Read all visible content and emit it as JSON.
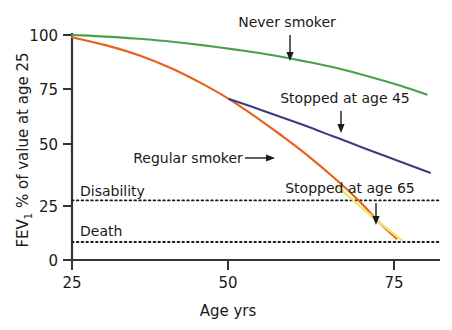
{
  "chart_data": {
    "type": "line",
    "title": "",
    "xlabel": "Age yrs",
    "ylabel": "FEV1 % of value at age 25",
    "ylabel_main": "FEV",
    "ylabel_sub": "1",
    "ylabel_rest": " % of value at age 25",
    "xlim": [
      25,
      80
    ],
    "ylim": [
      0,
      105
    ],
    "xticks": [
      25,
      50,
      75
    ],
    "xticklabels": [
      "25",
      "50",
      "75"
    ],
    "yticks": [
      0,
      25,
      50,
      75,
      100
    ],
    "yticklabels": [
      "0",
      "25",
      "50",
      "75",
      "100"
    ],
    "grid": false,
    "legend": "annotations-with-arrows",
    "series": [
      {
        "name": "Never smoker",
        "color": "#4aa04a",
        "label": "Never smoker",
        "points": [
          {
            "x": 25,
            "y": 100
          },
          {
            "x": 30,
            "y": 99.3
          },
          {
            "x": 35,
            "y": 98.3
          },
          {
            "x": 40,
            "y": 97.0
          },
          {
            "x": 45,
            "y": 95.3
          },
          {
            "x": 50,
            "y": 93.3
          },
          {
            "x": 55,
            "y": 91.0
          },
          {
            "x": 60,
            "y": 88.2
          },
          {
            "x": 65,
            "y": 85.0
          },
          {
            "x": 70,
            "y": 81.0
          },
          {
            "x": 75,
            "y": 76.6
          },
          {
            "x": 78,
            "y": 73.5
          }
        ]
      },
      {
        "name": "Regular smoker",
        "color": "#e8601c",
        "label": "Regular smoker",
        "points": [
          {
            "x": 25,
            "y": 99
          },
          {
            "x": 30,
            "y": 95.5
          },
          {
            "x": 35,
            "y": 91.0
          },
          {
            "x": 40,
            "y": 85.0
          },
          {
            "x": 45,
            "y": 77.5
          },
          {
            "x": 48.5,
            "y": 71.5
          },
          {
            "x": 52,
            "y": 64.5
          },
          {
            "x": 56,
            "y": 56.0
          },
          {
            "x": 60,
            "y": 47.0
          },
          {
            "x": 64,
            "y": 37.0
          },
          {
            "x": 68,
            "y": 26.0
          },
          {
            "x": 71,
            "y": 16.5
          },
          {
            "x": 73.5,
            "y": 9.5
          }
        ]
      },
      {
        "name": "Stopped at age 45",
        "color": "#3b3f7a",
        "label": "Stopped at age 45",
        "points": [
          {
            "x": 48.5,
            "y": 71.5
          },
          {
            "x": 52,
            "y": 68.0
          },
          {
            "x": 56,
            "y": 63.8
          },
          {
            "x": 60,
            "y": 59.5
          },
          {
            "x": 64,
            "y": 55.0
          },
          {
            "x": 68,
            "y": 50.5
          },
          {
            "x": 72,
            "y": 46.0
          },
          {
            "x": 76,
            "y": 41.6
          },
          {
            "x": 78.5,
            "y": 38.8
          }
        ]
      },
      {
        "name": "Stopped at age 65",
        "color": "#ece669",
        "label": "Stopped at age 65",
        "points": [
          {
            "x": 64.5,
            "y": 33.0
          },
          {
            "x": 68,
            "y": 24.0
          },
          {
            "x": 71,
            "y": 16.5
          },
          {
            "x": 74.2,
            "y": 9.0
          }
        ]
      }
    ],
    "thresholds": [
      {
        "label": "Disability",
        "value": 26.5,
        "style": "dotted"
      },
      {
        "label": "Death",
        "value": 8.0,
        "style": "dotted"
      }
    ],
    "annotations": [
      {
        "text": "Never smoker",
        "arrow": "down"
      },
      {
        "text": "Stopped at age 45",
        "arrow": "down"
      },
      {
        "text": "Regular smoker",
        "arrow": "right"
      },
      {
        "text": "Stopped at age 65",
        "arrow": "down"
      }
    ]
  },
  "axes": {
    "x_title": "Age yrs",
    "y_title_main": "FEV",
    "y_title_sub": "1",
    "y_title_rest": " % of value at age 25",
    "xticklabels": [
      "25",
      "50",
      "75"
    ],
    "yticklabels": [
      "0",
      "25",
      "50",
      "75",
      "100"
    ]
  },
  "labels": {
    "never_smoker": "Never smoker",
    "stopped_45": "Stopped at age 45",
    "regular_smoker": "Regular smoker",
    "stopped_65": "Stopped at age 65",
    "disability": "Disability",
    "death": "Death"
  },
  "colors": {
    "never_smoker": "#4aa04a",
    "regular_smoker": "#e8601c",
    "stopped_45": "#3b3f7a",
    "stopped_65": "#ece669",
    "axis": "#333333",
    "text": "#1a1a1a"
  }
}
